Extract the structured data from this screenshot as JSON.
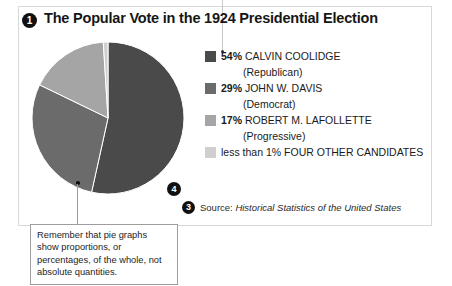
{
  "page": {
    "title": "The Popular Vote in the 1924 Presidential Election",
    "markers": {
      "one": "1",
      "three": "3",
      "four": "4"
    },
    "source_prefix": "Source:",
    "source_title": "Historical Statistics of the United States",
    "annotation": "Remember that pie graphs show proportions, or percentages, of the whole, not absolute quantities."
  },
  "legend": {
    "rows": [
      {
        "pct": "54%",
        "name": "CALVIN COOLIDGE",
        "party": "(Republican)",
        "color": "#4a4a4a"
      },
      {
        "pct": "29%",
        "name": "JOHN W. DAVIS",
        "party": "(Democrat)",
        "color": "#6b6b6b"
      },
      {
        "pct": "17%",
        "name": "ROBERT M. LAFOLLETTE",
        "party": "(Progressive)",
        "color": "#a5a5a5"
      },
      {
        "pct": "less than 1%",
        "name": "FOUR OTHER CANDIDATES",
        "party": "",
        "color": "#cfcfcf"
      }
    ]
  },
  "chart_data": {
    "type": "pie",
    "title": "The Popular Vote in the 1924 Presidential Election",
    "categories": [
      "CALVIN COOLIDGE (Republican)",
      "JOHN W. DAVIS (Democrat)",
      "ROBERT M. LAFOLLETTE (Progressive)",
      "FOUR OTHER CANDIDATES"
    ],
    "values": [
      54,
      29,
      17,
      1
    ],
    "value_labels": [
      "54%",
      "29%",
      "17%",
      "less than 1%"
    ],
    "colors": [
      "#4a4a4a",
      "#6b6b6b",
      "#a5a5a5",
      "#cfcfcf"
    ],
    "start_angle_deg": 0,
    "direction": "clockwise",
    "legend_position": "right",
    "grid": false,
    "source": "Historical Statistics of the United States",
    "note": "Remember that pie graphs show proportions, or percentages, of the whole, not absolute quantities."
  }
}
